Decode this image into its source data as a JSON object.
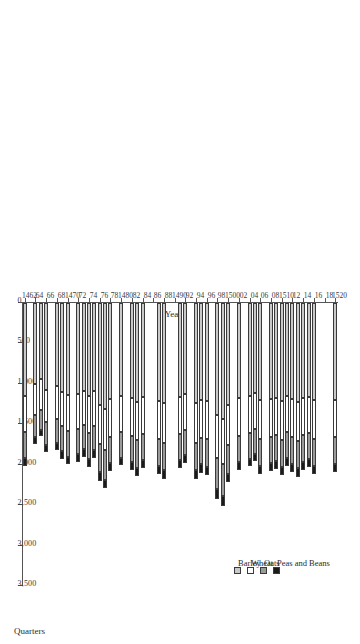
{
  "chart_data": {
    "type": "bar",
    "orientation": "horizontal-stacked",
    "title": "",
    "xlabel": "Quarters",
    "ylabel": "Year",
    "xlim": [
      0,
      3500
    ],
    "xticks": [
      "3,500",
      "3,000",
      "2,500",
      "2,000",
      "1,500",
      "1,000",
      "500",
      "0"
    ],
    "xtick_values": [
      3500,
      3000,
      2500,
      2000,
      1500,
      1000,
      500,
      0
    ],
    "grid": false,
    "legend_position": "inside-lower-left",
    "legend": [
      "Barley",
      "Wheat",
      "Oats",
      "Peas and Beans"
    ],
    "series_colors": [
      "#c9c9c9",
      "#ffffff",
      "#9a9a9a",
      "#1a1a1a"
    ],
    "categories": [
      "1462",
      "63",
      "64",
      "65",
      "66",
      "67",
      "68",
      "69",
      "1470",
      "71",
      "72",
      "73",
      "74",
      "75",
      "76",
      "77",
      "78",
      "79",
      "1480",
      "81",
      "82",
      "83",
      "84",
      "85",
      "86",
      "87",
      "88",
      "89",
      "1490",
      "91",
      "92",
      "93",
      "94",
      "95",
      "96",
      "97",
      "98",
      "99",
      "1500",
      "01",
      "02",
      "03",
      "04",
      "05",
      "06",
      "07",
      "08",
      "09",
      "1510",
      "11",
      "12",
      "13",
      "14",
      "15",
      "16",
      "17",
      "18",
      "19",
      "1520"
    ],
    "category_tick_labels": [
      "1462",
      "64",
      "66",
      "68",
      "1470",
      "72",
      "74",
      "76",
      "78",
      "1480",
      "82",
      "84",
      "86",
      "88",
      "1490",
      "92",
      "94",
      "96",
      "98",
      "1500",
      "02",
      "04",
      "06",
      "08",
      "1510",
      "12",
      "14",
      "16",
      "18",
      "1520"
    ],
    "series": [
      {
        "name": "Barley",
        "values": [
          1146,
          0,
          1005,
          946,
          1070,
          0,
          1022,
          1097,
          1140,
          0,
          1120,
          1092,
          1150,
          1088,
          1260,
          1310,
          1190,
          0,
          1145,
          0,
          1175,
          1220,
          1160,
          0,
          0,
          1208,
          1240,
          0,
          0,
          1168,
          1130,
          0,
          1240,
          1195,
          1210,
          0,
          1382,
          1430,
          1265,
          0,
          1180,
          0,
          1155,
          1118,
          1205,
          0,
          1188,
          1172,
          1216,
          1150,
          1192,
          1225,
          1178,
          1160,
          1205,
          0,
          0,
          0,
          1195
        ]
      },
      {
        "name": "Wheat",
        "values": [
          452,
          0,
          386,
          372,
          402,
          0,
          418,
          430,
          445,
          0,
          438,
          420,
          455,
          430,
          488,
          512,
          462,
          0,
          448,
          0,
          466,
          480,
          458,
          0,
          0,
          474,
          486,
          0,
          0,
          452,
          440,
          0,
          486,
          470,
          478,
          0,
          540,
          562,
          496,
          0,
          462,
          0,
          450,
          436,
          472,
          0,
          464,
          458,
          476,
          448,
          468,
          480,
          460,
          452,
          472,
          0,
          0,
          0,
          468
        ]
      },
      {
        "name": "Oats",
        "values": [
          318,
          0,
          272,
          258,
          285,
          0,
          294,
          305,
          315,
          0,
          310,
          298,
          322,
          304,
          346,
          362,
          328,
          0,
          318,
          0,
          330,
          340,
          324,
          0,
          0,
          336,
          344,
          0,
          0,
          320,
          312,
          0,
          344,
          332,
          338,
          0,
          382,
          398,
          352,
          0,
          328,
          0,
          320,
          310,
          334,
          0,
          328,
          324,
          338,
          318,
          332,
          340,
          326,
          320,
          334,
          0,
          0,
          0,
          332
        ]
      },
      {
        "name": "Peas and Beans",
        "values": [
          96,
          0,
          78,
          74,
          84,
          0,
          88,
          92,
          95,
          0,
          93,
          89,
          97,
          91,
          104,
          110,
          99,
          0,
          96,
          0,
          99,
          102,
          97,
          0,
          0,
          101,
          104,
          0,
          0,
          96,
          94,
          0,
          104,
          100,
          102,
          0,
          116,
          120,
          106,
          0,
          99,
          0,
          96,
          93,
          100,
          0,
          99,
          97,
          102,
          96,
          100,
          102,
          98,
          96,
          100,
          0,
          0,
          0,
          100
        ]
      }
    ]
  },
  "axis": {
    "value_axis_title": "Quarters",
    "category_axis_title": "Year"
  }
}
